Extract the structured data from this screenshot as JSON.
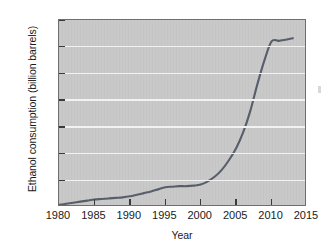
{
  "chart_data": {
    "type": "line",
    "title": "",
    "xlabel": "Year",
    "ylabel": "Ethanol consumption (billion barrels)",
    "xlim": [
      1980,
      2015
    ],
    "ylim": [
      0,
      350
    ],
    "xticks": [
      1980,
      1985,
      1990,
      1995,
      2000,
      2005,
      2010,
      2015
    ],
    "yticks": [
      0,
      50,
      100,
      150,
      200,
      250,
      300,
      350
    ],
    "grid": "horizontal",
    "legend": "none",
    "series": [
      {
        "name": "Ethanol consumption",
        "color": "#585f6b",
        "x": [
          1980,
          1981,
          1982,
          1983,
          1984,
          1985,
          1986,
          1987,
          1988,
          1989,
          1990,
          1991,
          1992,
          1993,
          1994,
          1995,
          1996,
          1997,
          1998,
          1999,
          2000,
          2001,
          2002,
          2003,
          2004,
          2005,
          2006,
          2007,
          2008,
          2009,
          2010,
          2011,
          2012,
          2013
        ],
        "values": [
          4,
          6,
          8,
          10,
          12,
          14,
          15,
          16,
          17,
          18,
          20,
          23,
          26,
          29,
          33,
          37,
          38,
          39,
          39,
          40,
          42,
          48,
          57,
          70,
          88,
          110,
          140,
          180,
          230,
          275,
          310,
          311,
          313,
          316
        ]
      }
    ],
    "axis_background": "#c9c9c9",
    "gridline_color": "#f2f2f2",
    "frame_color": "#6e6e6e"
  },
  "chart": {
    "ylabel_text": "Ethanol consumption (billion barrels)",
    "xlabel_text": "Year",
    "ytick_labels": [
      "350",
      "300",
      "250",
      "200",
      "150",
      "100",
      "50",
      "0"
    ],
    "xtick_labels": [
      "1980",
      "1985",
      "1990",
      "1995",
      "2000",
      "2005",
      "2010",
      "2015"
    ]
  }
}
